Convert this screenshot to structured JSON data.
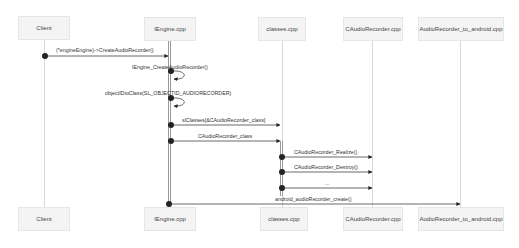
{
  "participants": {
    "client": "Client",
    "iengine": "IEngine.cpp",
    "classes": "classes.cpp",
    "caudiorecorder": "CAudioRecorder.cpp",
    "android": "AudioRecorder_to_android.cpp"
  },
  "messages": [
    {
      "n": 1,
      "from": "Client",
      "to": "IEngine.cpp",
      "label": "(*engineEngine)->CreateAudioRecorder()"
    },
    {
      "n": 2,
      "from": "IEngine.cpp",
      "to": "IEngine.cpp",
      "label": "IEngine_CreateAudioRecorder()"
    },
    {
      "n": 3,
      "from": "IEngine.cpp",
      "to": "IEngine.cpp",
      "label": "objectIDtoClass(SL_OBJECTID_AUDIORECORDER)"
    },
    {
      "n": 4,
      "from": "IEngine.cpp",
      "to": "classes.cpp",
      "label": "slClasses[&CAudioRecorder_class]"
    },
    {
      "n": 5,
      "from": "IEngine.cpp",
      "to": "classes.cpp",
      "label": "CAudioRecorder_class"
    },
    {
      "n": 6,
      "from": "classes.cpp",
      "to": "CAudioRecorder.cpp",
      "label": "CAudioRecorder_Realize()"
    },
    {
      "n": 7,
      "from": "classes.cpp",
      "to": "CAudioRecorder.cpp",
      "label": "CAudioRecorder_Destroy()"
    },
    {
      "n": 8,
      "from": "classes.cpp",
      "to": "CAudioRecorder.cpp",
      "label": "..."
    },
    {
      "n": 9,
      "from": "IEngine.cpp",
      "to": "AudioRecorder_to_android.cpp",
      "label": "android_audioRecorder_create()"
    }
  ]
}
